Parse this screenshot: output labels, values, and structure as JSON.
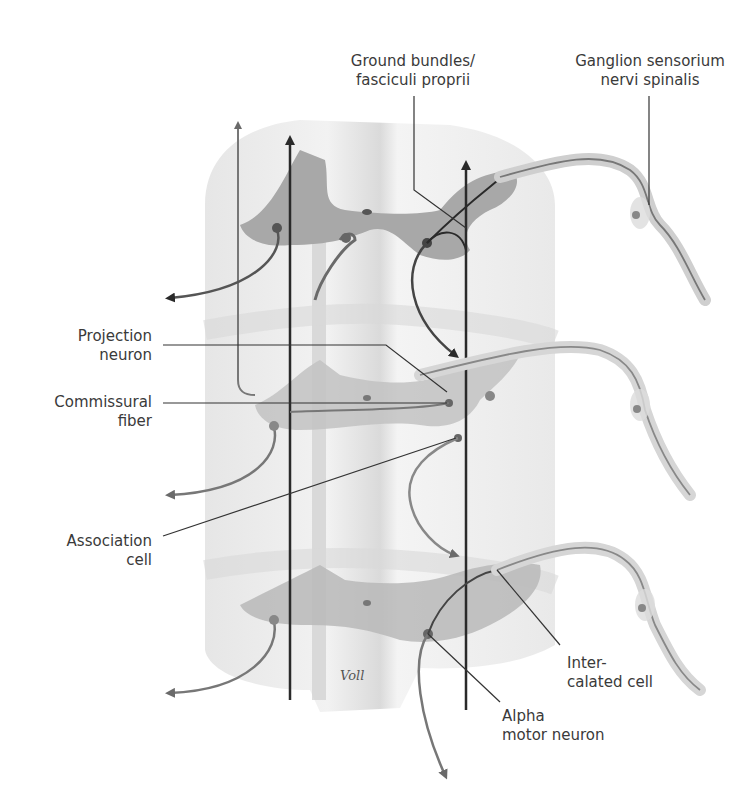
{
  "figure": {
    "signature": "Voll",
    "colors": {
      "white_matter": "#ececec",
      "gray_matter": "#a8a8a8",
      "fiber_dark": "#2a2a2a",
      "fiber_gray": "#777777",
      "label_text": "#3a3a3a",
      "leader_line": "#333333"
    }
  },
  "labels": {
    "ground_bundles": {
      "line1": "Ground bundles/",
      "line2": "fasciculi proprii"
    },
    "ganglion": {
      "line1": "Ganglion sensorium",
      "line2": "nervi spinalis"
    },
    "projection_neuron": {
      "line1": "Projection",
      "line2": "neuron"
    },
    "commissural_fiber": {
      "line1": "Commissural",
      "line2": "fiber"
    },
    "association_cell": {
      "line1": "Association",
      "line2": "cell"
    },
    "intercalated_cell": {
      "line1": "Inter-",
      "line2": "calated cell"
    },
    "alpha_motor_neuron": {
      "line1": "Alpha",
      "line2": "motor neuron"
    }
  }
}
